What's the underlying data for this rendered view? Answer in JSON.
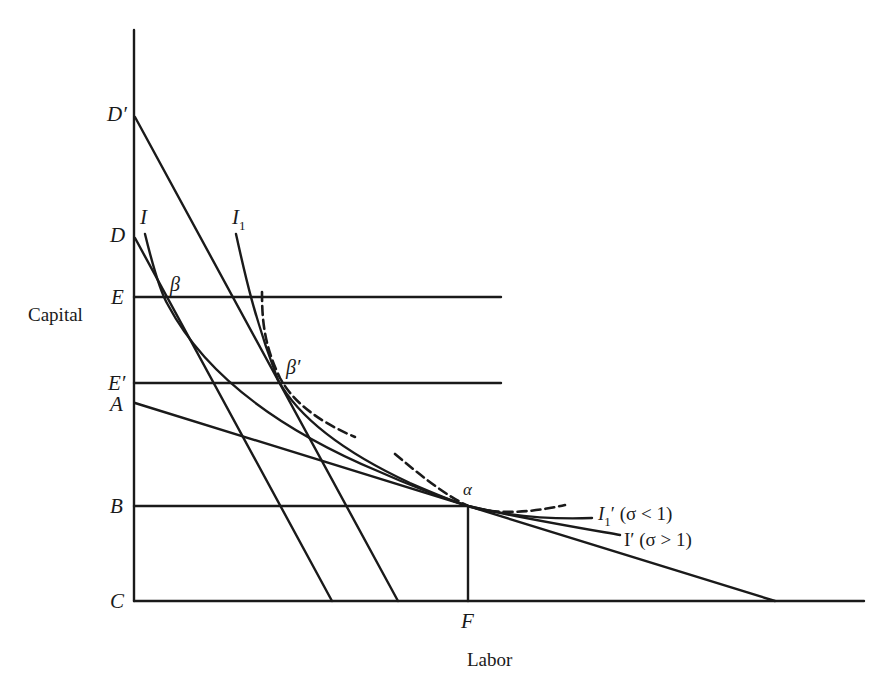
{
  "diagram": {
    "axes": {
      "y_label": "Capital",
      "x_label": "Labor"
    },
    "y_axis_points": [
      {
        "id": "D_prime",
        "label": "D′"
      },
      {
        "id": "D",
        "label": "D"
      },
      {
        "id": "E",
        "label": "E"
      },
      {
        "id": "E_prime",
        "label": "E′"
      },
      {
        "id": "A",
        "label": "A"
      },
      {
        "id": "B",
        "label": "B"
      },
      {
        "id": "C",
        "label": "C"
      }
    ],
    "x_axis_points": [
      {
        "id": "F",
        "label": "F"
      }
    ],
    "curve_labels": {
      "I": "I",
      "I1": "I",
      "I1_sub": "1",
      "I1_prime": "I",
      "I1_prime_sub": "1",
      "I1_prime_suffix": "′ (σ < 1)",
      "I_prime": "I′ (σ > 1)"
    },
    "point_labels": {
      "beta": "β",
      "beta_prime": "β′",
      "alpha": "α"
    },
    "colors": {
      "line": "#1a1a1a",
      "background": "#ffffff"
    }
  }
}
